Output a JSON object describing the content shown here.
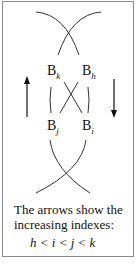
{
  "diagram": {
    "nodes": [
      {
        "id": "Bk",
        "base": "B",
        "sub": "k"
      },
      {
        "id": "Bh",
        "base": "B",
        "sub": "h"
      },
      {
        "id": "Bj",
        "base": "B",
        "sub": "j"
      },
      {
        "id": "Bi",
        "base": "B",
        "sub": "i"
      }
    ],
    "arrows": [
      {
        "direction": "up",
        "side": "left"
      },
      {
        "direction": "down",
        "side": "right"
      }
    ],
    "description_line1": "The arrows show the",
    "description_line2": "increasing indexes:",
    "formula": "h < i < j < k"
  }
}
